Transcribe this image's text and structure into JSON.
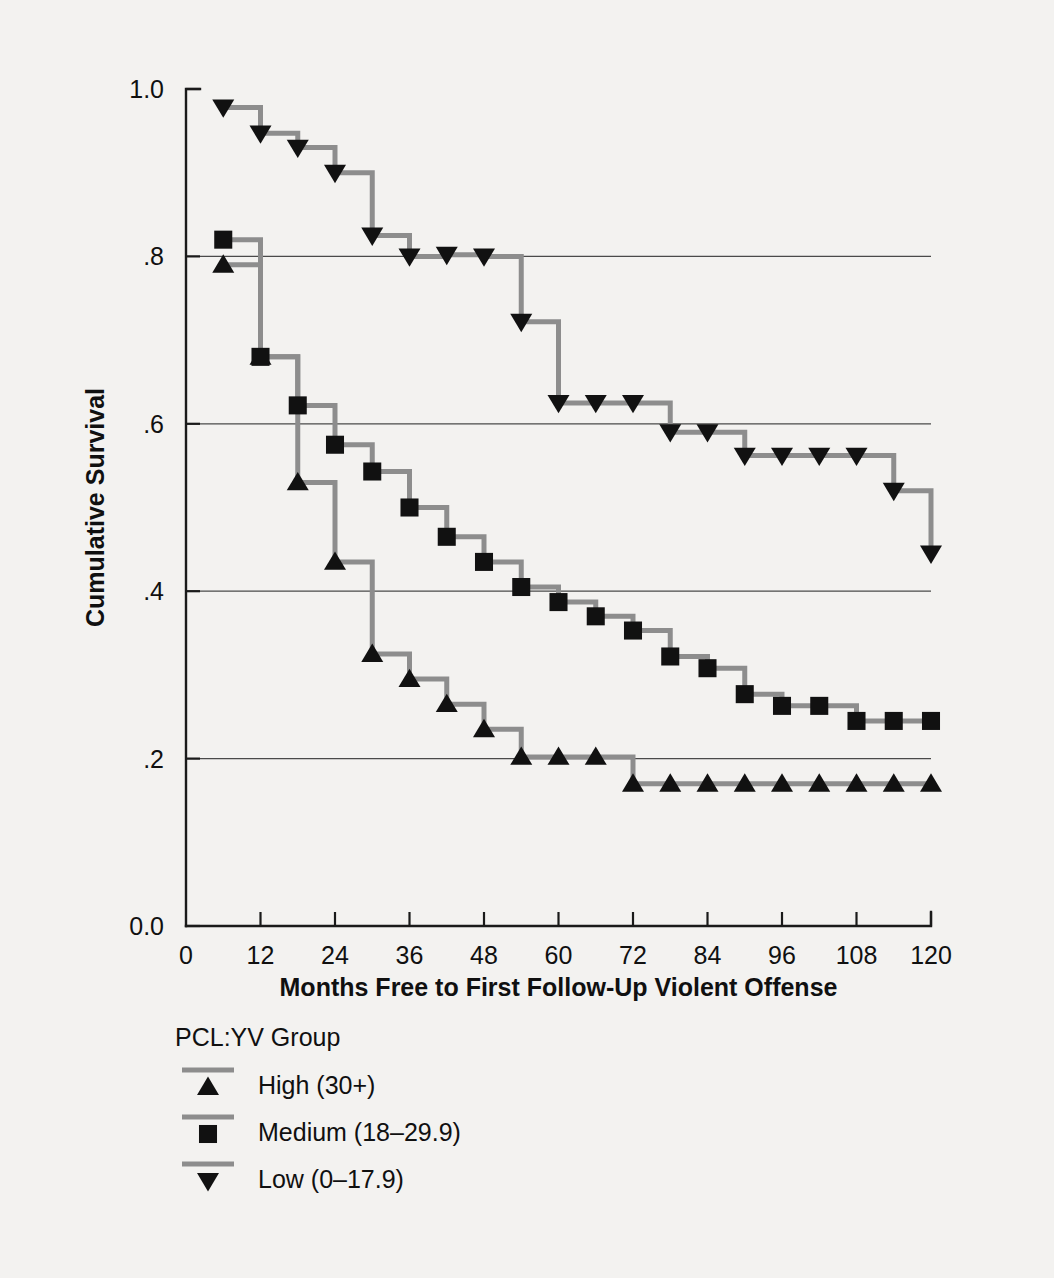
{
  "chart_data": {
    "type": "line",
    "subtype": "kaplan-meier-step",
    "title": "",
    "xlabel": "Months Free to First Follow-Up Violent Offense",
    "ylabel": "Cumulative Survival",
    "xlim": [
      0,
      120
    ],
    "ylim": [
      0.0,
      1.0
    ],
    "xticks": [
      0,
      12,
      24,
      36,
      48,
      60,
      72,
      84,
      96,
      108,
      120
    ],
    "xticklabels": [
      "0",
      "12",
      "24",
      "36",
      "48",
      "60",
      "72",
      "84",
      "96",
      "108",
      "120"
    ],
    "yticks": [
      0.0,
      0.2,
      0.4,
      0.6,
      0.8,
      1.0
    ],
    "yticklabels": [
      "0.0",
      ".2",
      ".4",
      ".6",
      ".8",
      "1.0"
    ],
    "grid": "horizontal",
    "gridlines_at": [
      0.2,
      0.4,
      0.6,
      0.8
    ],
    "legend_position": "below-plot-left",
    "legend_title": "PCL:YV Group",
    "line_color": "#8d8d8d",
    "marker_color": "#111111",
    "series": [
      {
        "name": "High (30+)",
        "marker": "triangle-up",
        "x": [
          6,
          12,
          18,
          24,
          30,
          36,
          42,
          48,
          54,
          60,
          66,
          72,
          78,
          84,
          90,
          96,
          102,
          108,
          114,
          120
        ],
        "y": [
          0.79,
          0.68,
          0.53,
          0.435,
          0.325,
          0.295,
          0.265,
          0.235,
          0.202,
          0.202,
          0.202,
          0.17,
          0.17,
          0.17,
          0.17,
          0.17,
          0.17,
          0.17,
          0.17,
          0.17
        ]
      },
      {
        "name": "Medium (18–29.9)",
        "marker": "square",
        "x": [
          6,
          12,
          18,
          24,
          30,
          36,
          42,
          48,
          54,
          60,
          66,
          72,
          78,
          84,
          90,
          96,
          102,
          108,
          114,
          120
        ],
        "y": [
          0.82,
          0.68,
          0.622,
          0.575,
          0.543,
          0.5,
          0.465,
          0.435,
          0.405,
          0.387,
          0.37,
          0.353,
          0.322,
          0.308,
          0.277,
          0.263,
          0.263,
          0.245,
          0.245,
          0.245
        ]
      },
      {
        "name": "Low (0–17.9)",
        "marker": "triangle-down",
        "x": [
          6,
          12,
          18,
          24,
          30,
          36,
          42,
          48,
          54,
          60,
          66,
          72,
          78,
          84,
          90,
          96,
          102,
          108,
          114,
          120
        ],
        "y": [
          0.978,
          0.947,
          0.93,
          0.9,
          0.825,
          0.8,
          0.802,
          0.8,
          0.722,
          0.625,
          0.625,
          0.625,
          0.59,
          0.59,
          0.562,
          0.562,
          0.562,
          0.562,
          0.52,
          0.445
        ]
      }
    ]
  },
  "legend": {
    "title": "PCL:YV Group",
    "entries": [
      {
        "label": "High (30+)",
        "marker": "triangle-up"
      },
      {
        "label": "Medium (18–29.9)",
        "marker": "square"
      },
      {
        "label": "Low (0–17.9)",
        "marker": "triangle-down"
      }
    ]
  }
}
